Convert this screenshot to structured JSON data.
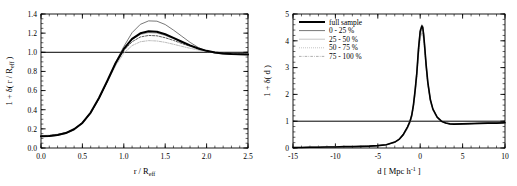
{
  "figure": {
    "background": "#ffffff",
    "panel_count": 2
  },
  "chart_data": [
    {
      "type": "line",
      "panel": "left",
      "title": "",
      "xlabel": "r / R_eff",
      "xlabel_parts": {
        "main": "r / R",
        "sub": "eff"
      },
      "ylabel": "1 + δ( r / R_eff )",
      "ylabel_parts": {
        "main": "1 + δ( r / R",
        "sub": "eff",
        "tail": " )"
      },
      "xlim": [
        0.0,
        2.5
      ],
      "ylim": [
        0.0,
        1.4
      ],
      "xticks": [
        0.0,
        0.5,
        1.0,
        1.5,
        2.0,
        2.5
      ],
      "xtick_labels": [
        "0.0",
        "0.5",
        "1.0",
        "1.5",
        "2.0",
        "2.5"
      ],
      "yticks": [
        0.0,
        0.2,
        0.4,
        0.6,
        0.8,
        1.0,
        1.2,
        1.4
      ],
      "ytick_labels": [
        "0.0",
        "0.2",
        "0.4",
        "0.6",
        "0.8",
        "1.0",
        "1.2",
        "1.4"
      ],
      "x_minor_step": 0.1,
      "y_minor_step": 0.05,
      "grid": false,
      "legend": null,
      "reference_line": {
        "y": 1.0,
        "color": "#000000",
        "width": 1.0
      },
      "x": [
        0.0,
        0.1,
        0.2,
        0.3,
        0.4,
        0.5,
        0.6,
        0.7,
        0.8,
        0.9,
        1.0,
        1.1,
        1.2,
        1.3,
        1.4,
        1.5,
        1.6,
        1.7,
        1.8,
        1.9,
        2.0,
        2.1,
        2.2,
        2.3,
        2.4,
        2.5
      ],
      "series": [
        {
          "name": "full sample",
          "style": "solid",
          "width": 2.0,
          "color": "#000000",
          "values": [
            0.122,
            0.126,
            0.136,
            0.156,
            0.196,
            0.262,
            0.37,
            0.522,
            0.7,
            0.885,
            1.035,
            1.14,
            1.198,
            1.22,
            1.215,
            1.188,
            1.15,
            1.11,
            1.072,
            1.04,
            1.015,
            0.998,
            0.988,
            0.982,
            0.979,
            0.977
          ]
        },
        {
          "name": "0 - 25 %",
          "style": "solid",
          "width": 0.8,
          "color": "#555555",
          "values": [
            0.118,
            0.122,
            0.132,
            0.152,
            0.192,
            0.258,
            0.362,
            0.512,
            0.694,
            0.89,
            1.06,
            1.205,
            1.292,
            1.328,
            1.325,
            1.29,
            1.232,
            1.168,
            1.104,
            1.05,
            1.012,
            0.992,
            0.982,
            0.978,
            0.976,
            0.975
          ]
        },
        {
          "name": "25 - 50 %",
          "style": "solid",
          "width": 0.7,
          "color": "#888888",
          "values": [
            0.122,
            0.126,
            0.136,
            0.157,
            0.197,
            0.263,
            0.369,
            0.518,
            0.696,
            0.884,
            1.032,
            1.132,
            1.186,
            1.205,
            1.2,
            1.176,
            1.142,
            1.104,
            1.068,
            1.038,
            1.014,
            0.998,
            0.988,
            0.983,
            0.98,
            0.978
          ]
        },
        {
          "name": "50 - 75 %",
          "style": "dashed",
          "width": 0.8,
          "color": "#333333",
          "values": [
            0.126,
            0.13,
            0.14,
            0.16,
            0.2,
            0.266,
            0.372,
            0.52,
            0.696,
            0.878,
            1.018,
            1.11,
            1.16,
            1.176,
            1.172,
            1.152,
            1.124,
            1.092,
            1.062,
            1.036,
            1.014,
            0.999,
            0.99,
            0.985,
            0.982,
            0.98
          ]
        },
        {
          "name": "75 - 100 %",
          "style": "dashdot",
          "width": 0.8,
          "color": "#aaaaaa",
          "values": [
            0.13,
            0.134,
            0.144,
            0.164,
            0.204,
            0.268,
            0.372,
            0.516,
            0.686,
            0.858,
            0.99,
            1.07,
            1.11,
            1.122,
            1.118,
            1.104,
            1.084,
            1.062,
            1.042,
            1.024,
            1.008,
            0.996,
            0.989,
            0.985,
            0.983,
            0.982
          ]
        }
      ]
    },
    {
      "type": "line",
      "panel": "right",
      "title": "",
      "xlabel": "d [ Mpc h^-1 ]",
      "xlabel_parts": {
        "main": "d  [ Mpc h",
        "sup": "-1",
        "tail": " ]"
      },
      "ylabel": "1 + δ( d )",
      "xlim": [
        -15,
        10
      ],
      "ylim": [
        0,
        5
      ],
      "xticks": [
        -15,
        -10,
        -5,
        0,
        5,
        10
      ],
      "xtick_labels": [
        "-15",
        "-10",
        "-5",
        "0",
        "5",
        "10"
      ],
      "yticks": [
        0,
        1,
        2,
        3,
        4,
        5
      ],
      "ytick_labels": [
        "0",
        "1",
        "2",
        "3",
        "4",
        "5"
      ],
      "x_minor_step": 1,
      "y_minor_step": 0.2,
      "grid": false,
      "legend": {
        "position": "upper-left",
        "entries": [
          {
            "label": "full sample",
            "style": "solid",
            "width": 2.0,
            "color": "#000000"
          },
          {
            "label": "0 - 25 %",
            "style": "solid",
            "width": 1.0,
            "color": "#777777"
          },
          {
            "label": "25 - 50 %",
            "style": "solid",
            "width": 0.7,
            "color": "#aaaaaa"
          },
          {
            "label": "50 - 75 %",
            "style": "dotted",
            "width": 0.8,
            "color": "#999999"
          },
          {
            "label": "75 - 100 %",
            "style": "dashdot",
            "width": 0.8,
            "color": "#999999"
          }
        ]
      },
      "reference_line": {
        "y": 1.0,
        "color": "#000000",
        "width": 1.0
      },
      "x": [
        -15,
        -14,
        -13,
        -12,
        -11,
        -10,
        -9,
        -8,
        -7,
        -6,
        -5,
        -4,
        -3,
        -2.5,
        -2,
        -1.5,
        -1.2,
        -1.0,
        -0.8,
        -0.6,
        -0.4,
        -0.2,
        0.0,
        0.2,
        0.3,
        0.4,
        0.5,
        0.7,
        0.9,
        1.2,
        1.5,
        2.0,
        2.5,
        3.0,
        3.5,
        4.0,
        5.0,
        6.0,
        7.0,
        8.0,
        9.0,
        10.0
      ],
      "series": [
        {
          "name": "full sample",
          "style": "solid",
          "width": 1.6,
          "color": "#000000",
          "values": [
            0.02,
            0.02,
            0.03,
            0.03,
            0.04,
            0.04,
            0.05,
            0.05,
            0.06,
            0.07,
            0.09,
            0.12,
            0.22,
            0.32,
            0.5,
            0.78,
            1.0,
            1.22,
            1.6,
            2.15,
            2.8,
            3.7,
            4.35,
            4.55,
            4.5,
            4.25,
            3.9,
            3.1,
            2.45,
            1.8,
            1.45,
            1.15,
            1.0,
            0.93,
            0.9,
            0.89,
            0.9,
            0.91,
            0.92,
            0.93,
            0.93,
            0.94
          ]
        },
        {
          "name": "0 - 25 %",
          "style": "solid",
          "width": 0.9,
          "color": "#777777",
          "values": [
            0.02,
            0.02,
            0.03,
            0.03,
            0.04,
            0.04,
            0.05,
            0.05,
            0.06,
            0.07,
            0.09,
            0.12,
            0.22,
            0.33,
            0.52,
            0.8,
            1.02,
            1.25,
            1.64,
            2.2,
            2.86,
            3.76,
            4.42,
            4.6,
            4.56,
            4.3,
            3.95,
            3.14,
            2.48,
            1.82,
            1.46,
            1.16,
            1.0,
            0.93,
            0.9,
            0.89,
            0.9,
            0.91,
            0.92,
            0.93,
            0.93,
            0.94
          ]
        },
        {
          "name": "25 - 50 %",
          "style": "solid",
          "width": 0.7,
          "color": "#aaaaaa",
          "values": [
            0.02,
            0.02,
            0.03,
            0.03,
            0.04,
            0.04,
            0.05,
            0.05,
            0.06,
            0.07,
            0.09,
            0.12,
            0.21,
            0.31,
            0.49,
            0.76,
            0.98,
            1.2,
            1.57,
            2.1,
            2.74,
            3.62,
            4.28,
            4.48,
            4.44,
            4.2,
            3.86,
            3.06,
            2.42,
            1.78,
            1.44,
            1.14,
            1.0,
            0.93,
            0.9,
            0.89,
            0.9,
            0.91,
            0.92,
            0.93,
            0.93,
            0.94
          ]
        },
        {
          "name": "50 - 75 %",
          "style": "dotted",
          "width": 0.8,
          "color": "#999999",
          "values": [
            0.02,
            0.02,
            0.03,
            0.03,
            0.04,
            0.04,
            0.05,
            0.05,
            0.06,
            0.07,
            0.09,
            0.12,
            0.21,
            0.3,
            0.48,
            0.75,
            0.96,
            1.18,
            1.54,
            2.06,
            2.7,
            3.56,
            4.2,
            4.4,
            4.36,
            4.14,
            3.8,
            3.02,
            2.38,
            1.76,
            1.42,
            1.13,
            1.0,
            0.93,
            0.9,
            0.89,
            0.9,
            0.91,
            0.92,
            0.93,
            0.93,
            0.94
          ]
        },
        {
          "name": "75 - 100 %",
          "style": "dashdot",
          "width": 0.8,
          "color": "#999999",
          "values": [
            0.02,
            0.02,
            0.03,
            0.03,
            0.04,
            0.04,
            0.05,
            0.05,
            0.06,
            0.07,
            0.09,
            0.12,
            0.2,
            0.29,
            0.46,
            0.72,
            0.93,
            1.14,
            1.5,
            2.0,
            2.62,
            3.46,
            4.1,
            4.3,
            4.26,
            4.04,
            3.72,
            2.96,
            2.34,
            1.73,
            1.4,
            1.12,
            1.0,
            0.93,
            0.9,
            0.89,
            0.9,
            0.91,
            0.92,
            0.93,
            0.93,
            0.94
          ]
        }
      ]
    }
  ]
}
